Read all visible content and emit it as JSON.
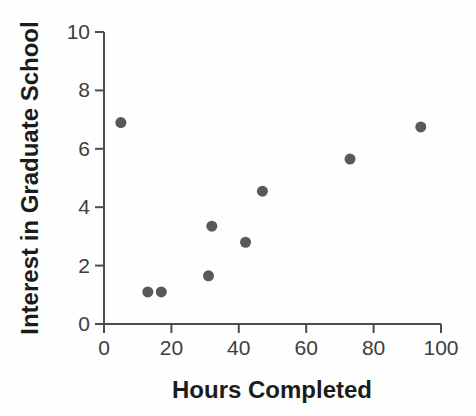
{
  "chart_data": {
    "type": "scatter",
    "title": "",
    "xlabel": "Hours Completed",
    "ylabel": "Interest in Graduate School",
    "xlim": [
      0,
      100
    ],
    "ylim": [
      0,
      10
    ],
    "xticks": [
      0,
      20,
      40,
      60,
      80,
      100
    ],
    "yticks": [
      0,
      2,
      4,
      6,
      8,
      10
    ],
    "grid": false,
    "legend": "none",
    "points": [
      {
        "x": 5,
        "y": 6.9
      },
      {
        "x": 13,
        "y": 1.1
      },
      {
        "x": 17,
        "y": 1.1
      },
      {
        "x": 31,
        "y": 1.65
      },
      {
        "x": 32,
        "y": 3.35
      },
      {
        "x": 42,
        "y": 2.8
      },
      {
        "x": 47,
        "y": 4.55
      },
      {
        "x": 73,
        "y": 5.65
      },
      {
        "x": 94,
        "y": 6.75
      }
    ],
    "marker": {
      "shape": "circle",
      "color": "#595959",
      "radius": 5.5
    },
    "colors": {
      "axis": "#4d4d4d",
      "tick_label": "#3d3d3d",
      "title": "#1c1c1c",
      "background": "#fefefe"
    }
  }
}
